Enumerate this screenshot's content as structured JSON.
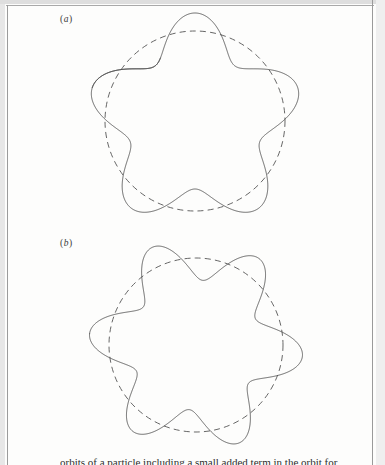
{
  "figure": {
    "panels": [
      {
        "id": "panel-a",
        "label_open": "(",
        "label_letter": "a",
        "label_close": ")",
        "label_text": "(a)",
        "curve_name": "precessing-rosette-orbit",
        "reference_name": "dashed-reference-circle"
      },
      {
        "id": "panel-b",
        "label_open": "(",
        "label_letter": "b",
        "label_close": ")",
        "label_text": "(b)",
        "curve_name": "precessing-rosette-orbit",
        "reference_name": "dashed-reference-circle"
      }
    ],
    "caption": "orbits of a particle including a small added term in the orbit for"
  },
  "colors": {
    "ink": "#4a4a4a",
    "label_ink": "#3b3b3b",
    "paper": "#fdfdfc",
    "frame": "#9b9b9b"
  },
  "chart_data": [
    {
      "type": "line",
      "title": "(a)",
      "xlabel": "",
      "ylabel": "",
      "grid": false,
      "legend": "none",
      "description": "Five-lobed precessing rosette orbit drawn over a dashed reference circle.",
      "series": [
        {
          "name": "rosette-orbit",
          "curve_type": "polar-rosette",
          "lobes": 5,
          "mean_radius": 88,
          "amplitude": 20,
          "phase_deg": 198,
          "turns": 1.12,
          "open_ended": true,
          "center": [
            195,
            121
          ],
          "stroke": "#4a4a4a",
          "dashed": false
        },
        {
          "name": "reference-circle",
          "curve_type": "circle",
          "radius": 90,
          "center": [
            195,
            121
          ],
          "stroke": "#4a4a4a",
          "dashed": true
        }
      ],
      "xlim": [
        83,
        307
      ],
      "ylim": [
        9,
        233
      ]
    },
    {
      "type": "line",
      "title": "(b)",
      "xlabel": "",
      "ylabel": "",
      "grid": false,
      "legend": "none",
      "description": "Six-lobed precessing rosette orbit drawn over a dashed reference circle.",
      "series": [
        {
          "name": "rosette-orbit",
          "curve_type": "polar-rosette",
          "lobes": 6,
          "mean_radius": 86,
          "amplitude": 21,
          "phase_deg": 186,
          "turns": 1.0,
          "open_ended": false,
          "center": [
            196,
            345
          ],
          "stroke": "#4a4a4a",
          "dashed": false
        },
        {
          "name": "reference-circle",
          "curve_type": "circle",
          "radius": 87,
          "center": [
            196,
            345
          ],
          "stroke": "#4a4a4a",
          "dashed": true
        }
      ],
      "xlim": [
        84,
        308
      ],
      "ylim": [
        233,
        457
      ]
    }
  ]
}
